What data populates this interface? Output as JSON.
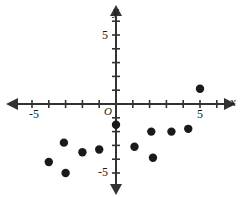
{
  "chart_data": {
    "type": "scatter",
    "title": "",
    "xlabel": "x",
    "ylabel": "y",
    "xlim": [
      -6.5,
      6.5
    ],
    "ylim": [
      -6.5,
      6.5
    ],
    "grid": false,
    "legend": null,
    "origin_label": "O",
    "x_tick_labels": [
      {
        "value": -5,
        "text": "-5"
      },
      {
        "value": 5,
        "text": "5"
      }
    ],
    "y_tick_labels": [
      {
        "value": 5,
        "text": "5"
      },
      {
        "value": -5,
        "text": "-5"
      }
    ],
    "tick_interval": 1,
    "point_color": "#1a1a1a",
    "axis_color": "#333333",
    "points": [
      {
        "x": -4.0,
        "y": -4.2
      },
      {
        "x": -3.1,
        "y": -2.8
      },
      {
        "x": -3.0,
        "y": -5.0
      },
      {
        "x": -2.0,
        "y": -3.5
      },
      {
        "x": -1.0,
        "y": -3.3
      },
      {
        "x": 0.0,
        "y": -1.5
      },
      {
        "x": 1.1,
        "y": -3.1
      },
      {
        "x": 2.1,
        "y": -2.0
      },
      {
        "x": 2.2,
        "y": -3.9
      },
      {
        "x": 3.3,
        "y": -2.0
      },
      {
        "x": 4.3,
        "y": -1.8
      },
      {
        "x": 5.0,
        "y": 1.1
      }
    ]
  },
  "labels": {
    "x_axis": "x",
    "y_axis": "y",
    "origin": "O",
    "x_neg_five": "-5",
    "x_pos_five": "5",
    "y_pos_five": "5",
    "y_neg_five": "-5"
  }
}
